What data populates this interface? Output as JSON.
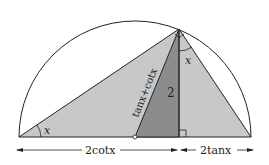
{
  "diagram": {
    "labels": {
      "angle_left": "x",
      "angle_top": "x",
      "hypotenuse": "tanx+cotx",
      "height": "2",
      "base_left": "2cotx",
      "base_right": "2tanx"
    },
    "colors": {
      "light_fill": "#c8c8c8",
      "dark_fill": "#8c8c8c",
      "stroke": "#222222"
    }
  }
}
